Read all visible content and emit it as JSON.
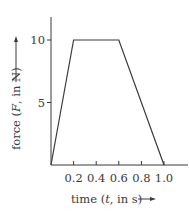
{
  "chart_data": {
    "type": "line",
    "title": "",
    "xlabel": "time (t, in s)",
    "ylabel": "force (F, in N)",
    "xlabel_parts": {
      "pre": "time (",
      "var": "t",
      "post": ", in s)"
    },
    "ylabel_parts": {
      "pre": "force (",
      "var": "F",
      "post": ", in N)"
    },
    "x": [
      0.0,
      0.2,
      0.6,
      1.0
    ],
    "series": [
      {
        "name": "force",
        "values": [
          0,
          10,
          10,
          0
        ]
      }
    ],
    "xlim": [
      0,
      1.0
    ],
    "ylim": [
      0,
      10
    ],
    "xticks": [
      0.2,
      0.4,
      0.6,
      0.8,
      1.0
    ],
    "xtick_labels": [
      "0.2",
      "0.4",
      "0.6",
      "0.8",
      "1.0"
    ],
    "yticks": [
      5,
      10
    ],
    "ytick_labels": [
      "5",
      "10"
    ],
    "grid": false,
    "legend": null
  },
  "colors": {
    "axis": "#3a3a3a",
    "line": "#3a3a3a",
    "background": "#ffffff"
  }
}
